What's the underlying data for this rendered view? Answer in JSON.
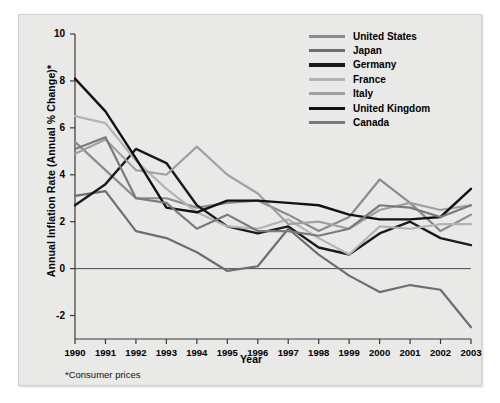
{
  "chart_data": {
    "type": "line",
    "title": "",
    "xlabel": "Year",
    "ylabel": "Annual Inflation Rate (Annual % Change)*",
    "footnote": "*Consumer prices",
    "grid": false,
    "legend_position": "top-right",
    "x": [
      1990,
      1991,
      1992,
      1993,
      1994,
      1995,
      1996,
      1997,
      1998,
      1999,
      2000,
      2001,
      2002,
      2003
    ],
    "xtick_labels": [
      "1990",
      "1991",
      "1992",
      "1993",
      "1994",
      "1995",
      "1996",
      "1997",
      "1998",
      "1999",
      "2000",
      "2001",
      "2002",
      "2003"
    ],
    "ytick_labels": [
      "10",
      "8",
      "6",
      "4",
      "2",
      "0",
      "-2"
    ],
    "ytick_values": [
      10,
      8,
      6,
      4,
      2,
      0,
      -2
    ],
    "xlim": [
      1990,
      2003
    ],
    "ylim": [
      -3,
      10
    ],
    "series": [
      {
        "name": "United States",
        "color": "#8c8c8c",
        "width": 2.2,
        "values": [
          5.4,
          4.2,
          3.0,
          3.0,
          2.6,
          2.8,
          2.9,
          2.3,
          1.6,
          2.2,
          3.8,
          2.8,
          1.6,
          2.3
        ]
      },
      {
        "name": "Japan",
        "color": "#6e6e6e",
        "width": 2.2,
        "values": [
          3.1,
          3.3,
          1.6,
          1.3,
          0.7,
          -0.1,
          0.1,
          1.7,
          0.6,
          -0.3,
          -1.0,
          -0.7,
          -0.9,
          -2.5
        ]
      },
      {
        "name": "Germany",
        "color": "#1a1a1a",
        "width": 2.4,
        "values": [
          2.7,
          3.6,
          5.1,
          4.5,
          2.7,
          1.8,
          1.5,
          1.8,
          0.9,
          0.6,
          1.5,
          2.0,
          1.3,
          1.0
        ]
      },
      {
        "name": "France",
        "color": "#b3b3b3",
        "width": 2.2,
        "values": [
          6.5,
          6.2,
          4.6,
          3.4,
          2.4,
          1.8,
          1.7,
          2.1,
          1.3,
          0.6,
          1.8,
          1.7,
          1.9,
          1.9
        ]
      },
      {
        "name": "Italy",
        "color": "#a0a0a0",
        "width": 2.2,
        "values": [
          4.9,
          5.5,
          4.2,
          4.0,
          5.2,
          4.0,
          3.2,
          1.9,
          2.0,
          1.7,
          2.5,
          2.8,
          2.5,
          2.7
        ]
      },
      {
        "name": "United Kingdom",
        "color": "#111111",
        "width": 2.4,
        "values": [
          8.1,
          6.7,
          4.7,
          2.6,
          2.4,
          2.9,
          2.9,
          2.8,
          2.7,
          2.3,
          2.1,
          2.1,
          2.2,
          3.4
        ]
      },
      {
        "name": "Canada",
        "color": "#7a7a7a",
        "width": 2.2,
        "values": [
          5.1,
          5.6,
          3.0,
          2.8,
          1.7,
          2.3,
          1.6,
          1.6,
          1.4,
          1.7,
          2.7,
          2.6,
          2.2,
          2.7
        ]
      }
    ]
  },
  "legend": {
    "items": [
      {
        "label": "United States"
      },
      {
        "label": "Japan"
      },
      {
        "label": "Germany"
      },
      {
        "label": "France"
      },
      {
        "label": "Italy"
      },
      {
        "label": "United Kingdom"
      },
      {
        "label": "Canada"
      }
    ]
  }
}
